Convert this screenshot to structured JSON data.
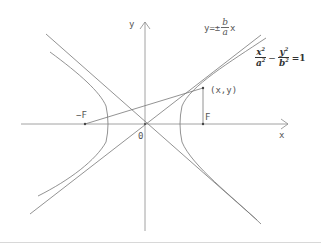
{
  "diagram": {
    "labels": {
      "y_axis": "y",
      "x_axis": "x",
      "origin": "0",
      "left_focus": "−F",
      "right_focus": "F",
      "point": "(x,y)"
    },
    "asymptote_equation": {
      "prefix": "y=±",
      "numerator": "b",
      "denominator": "a",
      "suffix": "x"
    },
    "hyperbola_equation": {
      "term1_num": "x",
      "term1_den": "a",
      "term2_num": "y",
      "term2_den": "b",
      "exponent": "2",
      "minus": "−",
      "equals": "=1"
    },
    "colors": {
      "stroke": "#777777",
      "axis": "#888888",
      "text": "#555555",
      "background": "#ffffff"
    }
  }
}
